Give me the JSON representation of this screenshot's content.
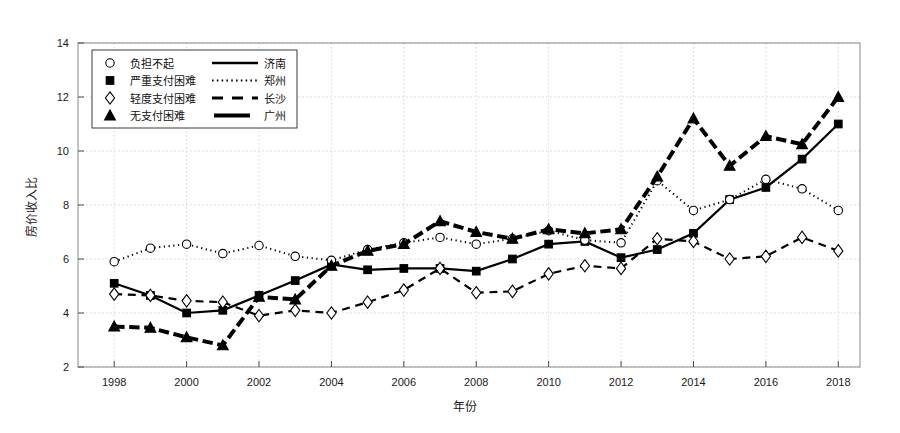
{
  "chart_data": {
    "type": "line",
    "title": "",
    "xlabel": "年份",
    "ylabel": "房价收入比",
    "xlim": [
      1997,
      2018.6
    ],
    "ylim": [
      2,
      14
    ],
    "ytick_values": [
      2,
      4,
      6,
      8,
      10,
      12,
      14
    ],
    "ytick_labels": [
      "2",
      "4",
      "6",
      "8",
      "10",
      "12",
      "14"
    ],
    "xtick_values": [
      1998,
      2000,
      2002,
      2004,
      2006,
      2008,
      2010,
      2012,
      2014,
      2016,
      2018
    ],
    "xtick_labels": [
      "1998",
      "2000",
      "2002",
      "2004",
      "2006",
      "2008",
      "2010",
      "2012",
      "2014",
      "2016",
      "2018"
    ],
    "grid": true,
    "grid_style": "dotted",
    "legend_position": "upper-left",
    "x": [
      1998,
      1999,
      2000,
      2001,
      2002,
      2003,
      2004,
      2005,
      2006,
      2007,
      2008,
      2009,
      2010,
      2011,
      2012,
      2013,
      2014,
      2015,
      2016,
      2017,
      2018
    ],
    "series": [
      {
        "name": "济南",
        "marker": "square-filled",
        "line": "solid",
        "line_width": 2.2,
        "values": [
          5.1,
          4.65,
          4.0,
          4.1,
          4.65,
          5.2,
          5.8,
          5.6,
          5.65,
          5.65,
          5.55,
          6.0,
          6.55,
          6.65,
          6.05,
          6.35,
          6.95,
          8.2,
          8.65,
          9.7,
          11.0
        ]
      },
      {
        "name": "郑州",
        "marker": "circle-open",
        "line": "dotted",
        "line_width": 2.0,
        "values": [
          5.9,
          6.4,
          6.55,
          6.2,
          6.5,
          6.1,
          5.95,
          6.35,
          6.6,
          6.8,
          6.55,
          6.75,
          7.05,
          6.7,
          6.6,
          8.9,
          7.8,
          8.2,
          8.95,
          8.6,
          7.8
        ]
      },
      {
        "name": "长沙",
        "marker": "diamond-open",
        "line": "dashed",
        "line_width": 2.2,
        "values": [
          4.7,
          4.65,
          4.45,
          4.4,
          3.9,
          4.1,
          4.0,
          4.4,
          4.85,
          5.65,
          4.75,
          4.8,
          5.45,
          5.75,
          5.65,
          6.75,
          6.65,
          6.0,
          6.1,
          6.8,
          6.3
        ]
      },
      {
        "name": "广州",
        "marker": "triangle-filled",
        "line": "thick-dashed",
        "line_width": 4.0,
        "values": [
          3.5,
          3.45,
          3.1,
          2.8,
          4.6,
          4.5,
          5.75,
          6.3,
          6.55,
          7.4,
          7.0,
          6.75,
          7.1,
          6.95,
          7.1,
          9.05,
          11.2,
          9.45,
          10.55,
          10.25,
          12.0
        ]
      }
    ]
  },
  "legend": {
    "entries": [
      {
        "marker_label": "负担不起",
        "marker": "circle-open",
        "line_label": "济南",
        "line": "solid"
      },
      {
        "marker_label": "严重支付困难",
        "marker": "square-filled",
        "line_label": "郑州",
        "line": "dotted"
      },
      {
        "marker_label": "轻度支付困难",
        "marker": "diamond-open",
        "line_label": "长沙",
        "line": "dashed"
      },
      {
        "marker_label": "无支付困难",
        "marker": "triangle-filled",
        "line_label": "广州",
        "line": "thick-solid"
      }
    ]
  },
  "colors": {
    "background": "#ffffff",
    "ink": "#000000",
    "frame": "#8a8a8a",
    "grid": "#c9c9c9"
  }
}
